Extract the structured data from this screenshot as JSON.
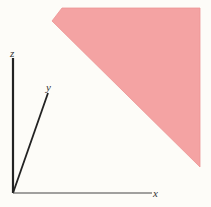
{
  "diagram": {
    "type": "3d-axes-with-plane",
    "axes": {
      "x": {
        "label": "x"
      },
      "y": {
        "label": "y"
      },
      "z": {
        "label": "z"
      }
    },
    "plane": {
      "color": "#f4a3a3",
      "edge_color": "#e88a8a"
    },
    "axis_color": "#222222"
  }
}
